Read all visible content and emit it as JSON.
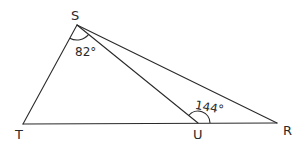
{
  "diagram": {
    "type": "triangle-geometry",
    "vertices": [
      {
        "name": "S",
        "x": 77,
        "y": 25
      },
      {
        "name": "T",
        "x": 23,
        "y": 124
      },
      {
        "name": "U",
        "x": 198,
        "y": 123
      },
      {
        "name": "R",
        "x": 277,
        "y": 123
      }
    ],
    "segments": [
      "ST",
      "SR",
      "SU",
      "TR"
    ],
    "labels": {
      "S": "S",
      "T": "T",
      "U": "U",
      "R": "R"
    },
    "angles": [
      {
        "vertex": "S",
        "between": "TSU",
        "value": "82°"
      },
      {
        "vertex": "U",
        "between": "SUR",
        "value": "144°"
      }
    ],
    "colors": {
      "line": "#2a2a2a",
      "background": "#ffffff"
    }
  }
}
